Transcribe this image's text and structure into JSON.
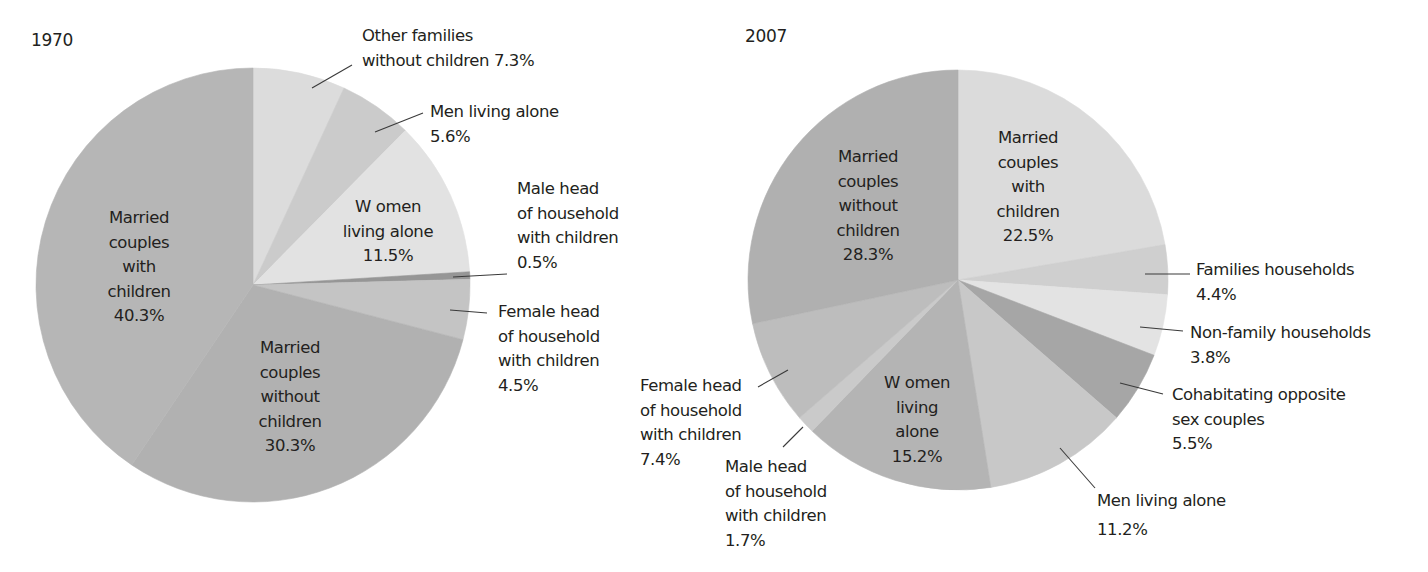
{
  "chart_data": [
    {
      "type": "pie",
      "title": "1970",
      "center": [
        253,
        285
      ],
      "radius": 217,
      "slices": [
        {
          "label": "Other families without children",
          "value": 7.3,
          "start_deg": 0,
          "end_deg": 24.8,
          "color": "#dcdcdc"
        },
        {
          "label": "Men living alone",
          "value": 5.6,
          "start_deg": 24.8,
          "end_deg": 44.6,
          "color": "#cbcbcb"
        },
        {
          "label": "Women living alone",
          "value": 11.5,
          "start_deg": 44.6,
          "end_deg": 86.5,
          "color": "#e2e2e2"
        },
        {
          "label": "Male head of household with children",
          "value": 0.5,
          "start_deg": 86.5,
          "end_deg": 88.5,
          "color": "#969696"
        },
        {
          "label": "Female head of household with children",
          "value": 4.5,
          "start_deg": 88.5,
          "end_deg": 104.6,
          "color": "#c4c4c4"
        },
        {
          "label": "Married couples without children",
          "value": 30.3,
          "start_deg": 104.6,
          "end_deg": 214,
          "color": "#b1b1b1"
        },
        {
          "label": "Married couples with children",
          "value": 40.3,
          "start_deg": 214,
          "end_deg": 360,
          "color": "#b6b6b6"
        }
      ]
    },
    {
      "type": "pie",
      "title": "2007",
      "center": [
        958,
        280
      ],
      "radius": 210,
      "slices": [
        {
          "label": "Married couples with children",
          "value": 22.5,
          "start_deg": 0,
          "end_deg": 80.3,
          "color": "#dbdbdb"
        },
        {
          "label": "Families households",
          "value": 4.4,
          "start_deg": 80.3,
          "end_deg": 94,
          "color": "#cfcfcf"
        },
        {
          "label": "Non-family households",
          "value": 3.8,
          "start_deg": 94,
          "end_deg": 111,
          "color": "#e3e3e3"
        },
        {
          "label": "Cohabitating opposite sex couples",
          "value": 5.5,
          "start_deg": 111,
          "end_deg": 131,
          "color": "#a6a6a6"
        },
        {
          "label": "Men living alone",
          "value": 11.2,
          "start_deg": 131,
          "end_deg": 171,
          "color": "#c8c8c8"
        },
        {
          "label": "Women living alone",
          "value": 15.2,
          "start_deg": 171,
          "end_deg": 224,
          "color": "#b4b4b4"
        },
        {
          "label": "Male head of household with children",
          "value": 1.7,
          "start_deg": 224,
          "end_deg": 229,
          "color": "#cacaca"
        },
        {
          "label": "Female head of household with children",
          "value": 7.4,
          "start_deg": 229,
          "end_deg": 258,
          "color": "#bdbdbd"
        },
        {
          "label": "Married couples without children",
          "value": 28.3,
          "start_deg": 258,
          "end_deg": 360,
          "color": "#b0b0b0"
        }
      ]
    }
  ],
  "charts": {
    "c1970": {
      "year": "1970",
      "labels": {
        "other_families": [
          "Other families",
          "without children 7.3%"
        ],
        "men_alone": [
          "Men living alone",
          "5.6%"
        ],
        "women_alone": [
          "W omen",
          "living alone",
          "11.5%"
        ],
        "male_head": [
          "Male head",
          "of household",
          "with children",
          "0.5%"
        ],
        "female_head": [
          "Female head",
          "of household",
          "with children",
          "4.5%"
        ],
        "married_without": [
          "Married",
          "couples",
          "without",
          "children",
          "30.3%"
        ],
        "married_with": [
          "Married",
          "couples",
          "with",
          "children",
          "40.3%"
        ]
      }
    },
    "c2007": {
      "year": "2007",
      "labels": {
        "married_without": [
          "Married",
          "couples",
          "without",
          "children",
          "28.3%"
        ],
        "married_with": [
          "Married",
          "couples",
          "with",
          "children",
          "22.5%"
        ],
        "families": [
          "Families households",
          "4.4%"
        ],
        "non_family": [
          "Non-family households",
          "3.8%"
        ],
        "cohab": [
          "Cohabitating opposite",
          "sex couples",
          "5.5%"
        ],
        "men_alone": [
          "Men living alone",
          "11.2%"
        ],
        "women_alone": [
          "W omen",
          "living",
          "alone",
          "15.2%"
        ],
        "male_head": [
          "Male head",
          "of household",
          "with children",
          "1.7%"
        ],
        "female_head": [
          "Female head",
          "of household",
          "with children",
          "7.4%"
        ]
      }
    }
  },
  "leaders": [
    [
      312,
      88,
      352,
      65
    ],
    [
      375,
      132,
      423,
      113
    ],
    [
      453,
      277,
      507,
      274
    ],
    [
      450,
      310,
      487,
      313
    ],
    [
      1145,
      274,
      1190,
      274
    ],
    [
      1140,
      327,
      1183,
      331
    ],
    [
      1120,
      383,
      1163,
      394
    ],
    [
      1060,
      448,
      1095,
      488
    ],
    [
      758,
      387,
      788,
      370
    ],
    [
      783,
      447,
      803,
      427
    ]
  ]
}
